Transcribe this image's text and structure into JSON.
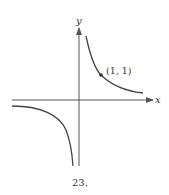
{
  "figure": {
    "number_label": "23.",
    "axes": {
      "x_label": "x",
      "y_label": "y"
    },
    "point": {
      "label": "(1, 1)",
      "x": 1,
      "y": 1
    },
    "function": "y = 1/x",
    "colors": {
      "axis": "#555555",
      "curve": "#444444",
      "text": "#333333",
      "background": "#ffffff"
    }
  }
}
